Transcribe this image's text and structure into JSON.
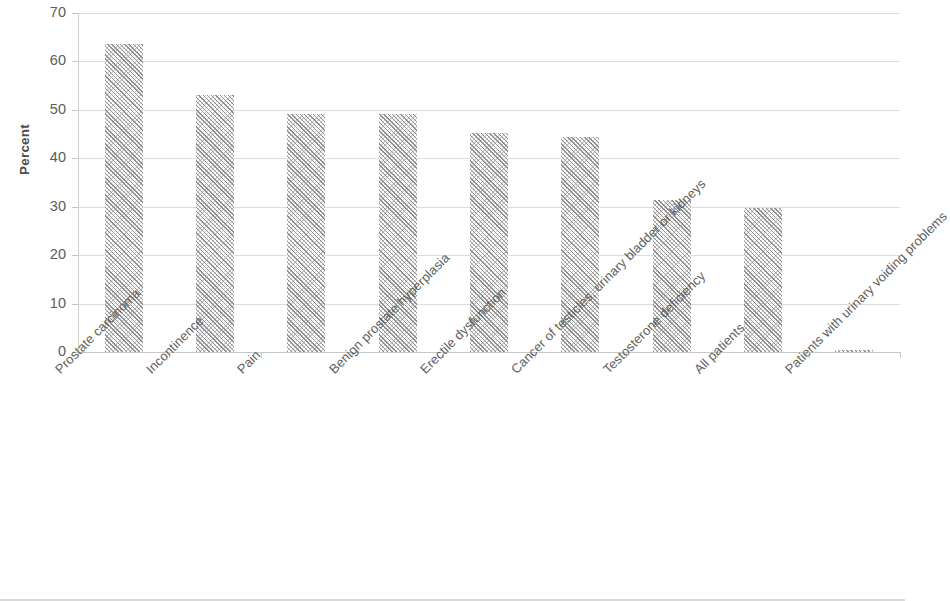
{
  "chart_data": {
    "type": "bar",
    "title": "",
    "subtitle": "",
    "xlabel": "",
    "ylabel": "Percent",
    "ylim": [
      0,
      70
    ],
    "ytick_step": 10,
    "yticks": [
      "70",
      "60",
      "50",
      "40",
      "30",
      "20",
      "10",
      "0"
    ],
    "grid": true,
    "legend": "none",
    "categories": [
      "Prostate carcinoma",
      "Incontinence",
      "Pain",
      "Benign prostate hyperplasia",
      "Erectile dysfunction",
      "Cancer of testicles, urinary bladder or kidneys",
      "Testosterone deficiency",
      "All patients",
      "Patients with urinary voiding problems"
    ],
    "values": [
      63.5,
      53.0,
      49.1,
      49.1,
      45.3,
      44.5,
      31.3,
      29.7,
      0.4
    ],
    "series": [
      {
        "name": "Percent",
        "values": [
          63.5,
          53.0,
          49.1,
          49.1,
          45.3,
          44.5,
          31.3,
          29.7,
          0.4
        ]
      }
    ],
    "bar_fill": "#8c8c8c",
    "bar_pattern": "diagonal-hatch",
    "gridline_color": "#dcdcdc",
    "axis_color": "#cfcfcf",
    "text_color": "#5c5c5c"
  }
}
